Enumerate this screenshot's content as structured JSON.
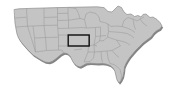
{
  "map": {
    "title": "United States",
    "projection": "albers-usa-pseudo",
    "width": 173,
    "height": 93,
    "background_color": "#ffffff",
    "land_fill_color": "#b9b9b9",
    "land_fill_color_light": "#c4c4c4",
    "state_border_color": "#9a9a9a",
    "outer_border_color": "#8c8c8c",
    "shadow_color": "#6e6e6e",
    "shadow_color_soft": "#858585",
    "highlight": {
      "name": "Kansas",
      "abbreviation": "KS",
      "outline_color": "#111111",
      "outline_width": 1.4,
      "fill": "none",
      "bounds": {
        "x": 68,
        "y": 35,
        "width": 21,
        "height": 11
      }
    },
    "regions": [
      {
        "name": "west",
        "label": "Western States"
      },
      {
        "name": "midwest",
        "label": "Midwestern States"
      },
      {
        "name": "south",
        "label": "Southern States"
      },
      {
        "name": "northeast",
        "label": "Northeastern States"
      }
    ],
    "visible_features": [
      "state-boundaries",
      "national-outline",
      "drop-shadow-relief",
      "highlighted-state"
    ]
  }
}
